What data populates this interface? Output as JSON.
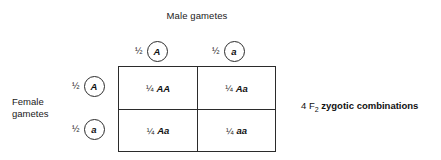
{
  "diagram": {
    "male_gametes_label": "Male gametes",
    "female_gametes_label_line1": "Female",
    "female_gametes_label_line2": "gametes",
    "male_gametes": [
      {
        "probability": "½",
        "allele": "A"
      },
      {
        "probability": "½",
        "allele": "a"
      }
    ],
    "female_gametes": [
      {
        "probability": "½",
        "allele": "A"
      },
      {
        "probability": "½",
        "allele": "a"
      }
    ],
    "punnett_cells": [
      {
        "probability": "¼",
        "genotype": "AA"
      },
      {
        "probability": "¼",
        "genotype": "Aa"
      },
      {
        "probability": "¼",
        "genotype": "Aa"
      },
      {
        "probability": "¼",
        "genotype": "aa"
      }
    ],
    "caption": {
      "count": "4 F",
      "generation_subscript": "2",
      "emphasis": "zygotic combinations"
    },
    "colors": {
      "background": "#ffffff",
      "line": "#2b2b2b",
      "text": "#111111"
    }
  }
}
